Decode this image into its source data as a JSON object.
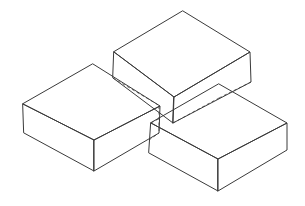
{
  "diagram": {
    "colors": {
      "line": "#3a3a3a",
      "hidden_line": "#5a5a5a",
      "background": "#ffffff"
    },
    "blocks": [
      {
        "name": "top-back-block",
        "top_face": [
          [
            183,
            11
          ],
          [
            250,
            52
          ],
          [
            174,
            97
          ],
          [
            114,
            52
          ]
        ],
        "left_face": [
          [
            114,
            52
          ],
          [
            174,
            97
          ],
          [
            173,
            123
          ],
          [
            113,
            78
          ]
        ],
        "right_face": [
          [
            174,
            97
          ],
          [
            250,
            52
          ],
          [
            251,
            82
          ],
          [
            173,
            123
          ]
        ]
      },
      {
        "name": "left-block",
        "top_face": [
          [
            93,
            64
          ],
          [
            160,
            106
          ],
          [
            94,
            140
          ],
          [
            23,
            104
          ]
        ],
        "left_face": [
          [
            23,
            104
          ],
          [
            94,
            140
          ],
          [
            94,
            171
          ],
          [
            24,
            133
          ]
        ],
        "right_face": [
          [
            94,
            140
          ],
          [
            160,
            106
          ],
          [
            159,
            133
          ],
          [
            94,
            171
          ]
        ]
      },
      {
        "name": "right-block",
        "top_face": [
          [
            219,
            84
          ],
          [
            287,
            123
          ],
          [
            218,
            159
          ],
          [
            151,
            123
          ]
        ],
        "left_face": [
          [
            151,
            123
          ],
          [
            218,
            159
          ],
          [
            218,
            191
          ],
          [
            149,
            153
          ]
        ],
        "right_face": [
          [
            218,
            159
          ],
          [
            287,
            123
          ],
          [
            287,
            150
          ],
          [
            218,
            191
          ]
        ]
      }
    ],
    "hidden_edges": [
      [
        [
          113,
          78
        ],
        [
          160,
          106
        ]
      ],
      [
        [
          173,
          123
        ],
        [
          219,
          98
        ]
      ],
      [
        [
          219,
          98
        ],
        [
          251,
          82
        ]
      ],
      [
        [
          159,
          106
        ],
        [
          159,
          133
        ]
      ],
      [
        [
          151,
          123
        ],
        [
          160,
          118
        ]
      ],
      [
        [
          149,
          140
        ],
        [
          159,
          133
        ]
      ]
    ]
  }
}
